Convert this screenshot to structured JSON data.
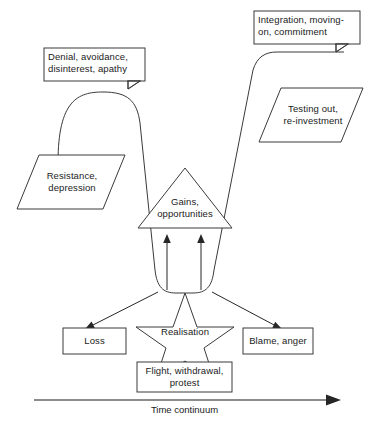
{
  "diagram": {
    "axis": {
      "label": "Time continuum",
      "arrow_direction": "right"
    },
    "colors": {
      "background": "#ffffff",
      "stroke": "#3a3a3a",
      "arrow": "#262626",
      "text": "#1b1b1b"
    },
    "callouts": [
      {
        "name": "denial-callout",
        "text": "Denial, avoidance,\ndisinterest, apathy"
      },
      {
        "name": "integration-callout",
        "text": "Integration, moving-\non, commitment"
      }
    ],
    "parallelograms": [
      {
        "name": "resistance-parallelogram",
        "text": "Resistance,\ndepression"
      },
      {
        "name": "testing-out-parallelogram",
        "text": "Testing out,\nre-investment"
      }
    ],
    "triangle": {
      "name": "gains-triangle",
      "text": "Gains,\nopportunities"
    },
    "star": {
      "name": "realisation-star",
      "text": "Realisation"
    },
    "boxes": [
      {
        "name": "loss-box",
        "text": "Loss"
      },
      {
        "name": "blame-anger-box",
        "text": "Blame, anger"
      },
      {
        "name": "flight-box",
        "text": "Flight, withdrawal,\nprotest"
      }
    ]
  }
}
